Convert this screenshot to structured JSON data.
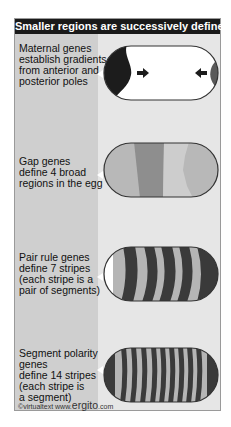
{
  "title": "Smaller regions are successively defined",
  "rows": [
    {
      "label": "Maternal genes\nestablish gradients\nfrom anterior and\nposterior poles",
      "stage": "maternal"
    },
    {
      "label": "Gap genes\ndefine 4 broad\nregions in the egg",
      "stage": "gap"
    },
    {
      "label": "Pair rule genes\ndefine 7 stripes\n(each stripe is a\npair of segments)",
      "stage": "pair-rule"
    },
    {
      "label": "Segment polarity\ngenes\ndefine 14 stripes\n(each stripe is\na segment)",
      "stage": "segment-polarity"
    }
  ],
  "footer": {
    "copyright": "©virtualtext www.",
    "brand": "ergito",
    "tld": ".com"
  },
  "colors": {
    "title_bg": "#1a1a1a",
    "panel_bg": "#e6e6e6",
    "left_col_bg": "#cfcfcf",
    "anterior_dark": "#1c1c1c",
    "posterior": "#5a5a5a",
    "gap_light": "#b8b8b8",
    "gap_dark": "#8e8e8e",
    "gap_lighter": "#cdcdcd",
    "stripe_dark": "#3a3a3a",
    "stripe_light": "#b5b5b5"
  }
}
